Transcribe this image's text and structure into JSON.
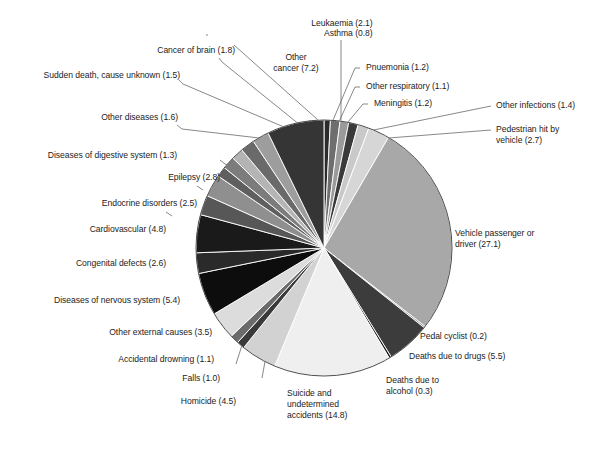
{
  "chart_data": {
    "type": "pie",
    "title": "",
    "xlabel": "",
    "ylabel": "",
    "units": "percent",
    "start_angle_deg": 0,
    "direction": "clockwise",
    "legend": "none",
    "grid": false,
    "labels_show_value_in_parentheses": true,
    "total": 100.0,
    "categories": [
      "Asthma",
      "Pnuemonia",
      "Other respiratory",
      "Meningitis",
      "Other infections",
      "Pedestrian hit by vehicle",
      "Vehicle passenger or driver",
      "Pedal cyclist",
      "Deaths due to drugs",
      "Deaths due to alcohol",
      "Suicide and undetermined accidents",
      "Homicide",
      "Falls",
      "Accidental drowning",
      "Other external causes",
      "Diseases of nervous system",
      "Congenital defects",
      "Cardiovascular",
      "Endocrine disorders",
      "Epilepsy",
      "Diseases of digestive system",
      "Other diseases",
      "Sudden death, cause unknown",
      "Cancer of brain",
      "Leukaemia",
      "Other cancer"
    ],
    "values": [
      0.8,
      1.2,
      1.1,
      1.2,
      1.4,
      2.7,
      27.1,
      0.2,
      5.5,
      0.3,
      14.8,
      4.5,
      1.0,
      1.1,
      3.5,
      5.4,
      2.6,
      4.8,
      2.5,
      2.8,
      1.3,
      1.6,
      1.5,
      1.8,
      2.1,
      7.2
    ],
    "colors": [
      "#2b2b2b",
      "#6e6e6e",
      "#9a9a9a",
      "#3a3a3a",
      "#c9c9c9",
      "#d6d6d6",
      "#a8a8a8",
      "#8c8c8c",
      "#3c3c3c",
      "#1d1d1d",
      "#efefef",
      "#d2d2d2",
      "#3a3a3a",
      "#6b6b6b",
      "#dcdcdc",
      "#0d0d0d",
      "#2a2a2a",
      "#1a1a1a",
      "#575757",
      "#8f8f8f",
      "#5f5f5f",
      "#7c7c7c",
      "#b4b4b4",
      "#6a6a6a",
      "#9d9d9d",
      "#353535"
    ]
  },
  "labels": [
    {
      "id": "leukaemia",
      "text": "Leukaemia (2.1)"
    },
    {
      "id": "cancer-of-brain",
      "text": "Cancer of brain (1.8)"
    },
    {
      "id": "sudden-death",
      "text": "Sudden death, cause unknown (1.5)"
    },
    {
      "id": "other-diseases",
      "text": "Other diseases (1.6)"
    },
    {
      "id": "digestive-system",
      "text": "Diseases of digestive system (1.3)"
    },
    {
      "id": "epilepsy",
      "text": "Epilepsy (2.8)"
    },
    {
      "id": "endocrine-disorders",
      "text": "Endocrine disorders (2.5)"
    },
    {
      "id": "cardiovascular",
      "text": "Cardiovascular (4.8)"
    },
    {
      "id": "congenital-defects",
      "text": "Congenital defects (2.6)"
    },
    {
      "id": "nervous-system",
      "text": "Diseases of nervous system (5.4)"
    },
    {
      "id": "other-external",
      "text": "Other external causes (3.5)"
    },
    {
      "id": "accidental-drowning",
      "text": "Accidental drowning (1.1)"
    },
    {
      "id": "falls",
      "text": "Falls (1.0)"
    },
    {
      "id": "homicide",
      "text": "Homicide (4.5)"
    },
    {
      "id": "other-cancer",
      "text": "Other\ncancer (7.2)"
    },
    {
      "id": "asthma",
      "text": "Asthma (0.8)"
    },
    {
      "id": "pnuemonia",
      "text": "Pnuemonia (1.2)"
    },
    {
      "id": "other-respiratory",
      "text": "Other respiratory (1.1)"
    },
    {
      "id": "meningitis",
      "text": "Meningitis (1.2)"
    },
    {
      "id": "other-infections",
      "text": "Other infections (1.4)"
    },
    {
      "id": "pedestrian",
      "text": "Pedestrian hit by\nvehicle (2.7)"
    },
    {
      "id": "vehicle-passenger",
      "text": "Vehicle passenger or\ndriver (27.1)"
    },
    {
      "id": "pedal-cyclist",
      "text": "Pedal cyclist (0.2)"
    },
    {
      "id": "deaths-drugs",
      "text": "Deaths due to drugs (5.5)"
    },
    {
      "id": "deaths-alcohol",
      "text": "Deaths due to\nalcohol (0.3)"
    },
    {
      "id": "suicide",
      "text": "Suicide and\nundetermined\naccidents (14.8)"
    }
  ]
}
